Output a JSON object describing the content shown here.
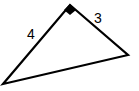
{
  "diagram": {
    "type": "right-triangle",
    "vertices": {
      "right_angle": [
        70,
        5
      ],
      "right": [
        128,
        55
      ],
      "bottom_left": [
        3,
        84
      ]
    },
    "sides": {
      "left_leg": {
        "label": "4"
      },
      "right_leg": {
        "label": "3"
      },
      "hypotenuse": {
        "label": ""
      }
    },
    "right_angle_marker": true,
    "stroke_color": "#000000"
  }
}
